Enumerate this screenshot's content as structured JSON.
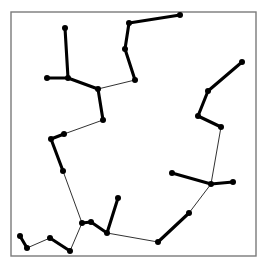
{
  "figure": {
    "title": "",
    "background_color": "#ffffff",
    "frame": {
      "x": 11,
      "y": 12,
      "width": 245,
      "height": 244,
      "stroke_color": "#7a7a7a",
      "fill_color": "#ffffff",
      "stroke_width": 1.4
    }
  },
  "chart_data": {
    "type": "scatter",
    "title": "",
    "xlabel": "",
    "ylabel": "",
    "grid": false,
    "legend": null,
    "axis_visible": false,
    "tick_labels": [],
    "node_style": {
      "shape": "circle",
      "radius": 3.0,
      "color": "#000000"
    },
    "edge_styles": {
      "thick": {
        "color": "#000000",
        "width": 3.1,
        "role": "cluster-chain"
      },
      "thin": {
        "color": "#1a1a1a",
        "width": 0.9,
        "role": "connector"
      }
    },
    "xlim": [
      11,
      256
    ],
    "ylim": [
      12,
      256
    ],
    "nodes": [
      {
        "id": 0,
        "label": "n0",
        "x": 65,
        "y": 28
      },
      {
        "id": 1,
        "label": "n1",
        "x": 68,
        "y": 78
      },
      {
        "id": 2,
        "label": "n2",
        "x": 47,
        "y": 78
      },
      {
        "id": 3,
        "label": "n3",
        "x": 98,
        "y": 89
      },
      {
        "id": 4,
        "label": "n4",
        "x": 103,
        "y": 120
      },
      {
        "id": 5,
        "label": "n5",
        "x": 64,
        "y": 134
      },
      {
        "id": 6,
        "label": "n6",
        "x": 51,
        "y": 139
      },
      {
        "id": 7,
        "label": "n7",
        "x": 63,
        "y": 171
      },
      {
        "id": 8,
        "label": "n8",
        "x": 180,
        "y": 15
      },
      {
        "id": 9,
        "label": "n9",
        "x": 129,
        "y": 23
      },
      {
        "id": 10,
        "label": "n10",
        "x": 125,
        "y": 49
      },
      {
        "id": 11,
        "label": "n11",
        "x": 135,
        "y": 80
      },
      {
        "id": 12,
        "label": "n12",
        "x": 242,
        "y": 62
      },
      {
        "id": 13,
        "label": "n13",
        "x": 208,
        "y": 91
      },
      {
        "id": 14,
        "label": "n14",
        "x": 198,
        "y": 116
      },
      {
        "id": 15,
        "label": "n15",
        "x": 221,
        "y": 127
      },
      {
        "id": 16,
        "label": "n16",
        "x": 172,
        "y": 173
      },
      {
        "id": 17,
        "label": "n17",
        "x": 211,
        "y": 184
      },
      {
        "id": 18,
        "label": "n18",
        "x": 233,
        "y": 182
      },
      {
        "id": 19,
        "label": "n19",
        "x": 189,
        "y": 213
      },
      {
        "id": 20,
        "label": "n20",
        "x": 158,
        "y": 242
      },
      {
        "id": 21,
        "label": "n21",
        "x": 118,
        "y": 198
      },
      {
        "id": 22,
        "label": "n22",
        "x": 107,
        "y": 233
      },
      {
        "id": 23,
        "label": "n23",
        "x": 91,
        "y": 222
      },
      {
        "id": 24,
        "label": "n24",
        "x": 82,
        "y": 223
      },
      {
        "id": 25,
        "label": "n25",
        "x": 70,
        "y": 251
      },
      {
        "id": 26,
        "label": "n26",
        "x": 50,
        "y": 238
      },
      {
        "id": 27,
        "label": "n27",
        "x": 27,
        "y": 248
      },
      {
        "id": 28,
        "label": "n28",
        "x": 20,
        "y": 236
      }
    ],
    "edges": [
      {
        "from": 0,
        "to": 1,
        "style": "thick"
      },
      {
        "from": 2,
        "to": 1,
        "style": "thick"
      },
      {
        "from": 1,
        "to": 3,
        "style": "thick"
      },
      {
        "from": 3,
        "to": 4,
        "style": "thick"
      },
      {
        "from": 3,
        "to": 11,
        "style": "thin"
      },
      {
        "from": 4,
        "to": 5,
        "style": "thin"
      },
      {
        "from": 5,
        "to": 6,
        "style": "thick"
      },
      {
        "from": 6,
        "to": 7,
        "style": "thick"
      },
      {
        "from": 7,
        "to": 24,
        "style": "thin"
      },
      {
        "from": 8,
        "to": 9,
        "style": "thick"
      },
      {
        "from": 9,
        "to": 10,
        "style": "thick"
      },
      {
        "from": 10,
        "to": 11,
        "style": "thick"
      },
      {
        "from": 12,
        "to": 13,
        "style": "thick"
      },
      {
        "from": 13,
        "to": 14,
        "style": "thick"
      },
      {
        "from": 14,
        "to": 15,
        "style": "thick"
      },
      {
        "from": 15,
        "to": 17,
        "style": "thin"
      },
      {
        "from": 16,
        "to": 17,
        "style": "thick"
      },
      {
        "from": 17,
        "to": 18,
        "style": "thick"
      },
      {
        "from": 17,
        "to": 19,
        "style": "thin"
      },
      {
        "from": 19,
        "to": 20,
        "style": "thick"
      },
      {
        "from": 20,
        "to": 22,
        "style": "thin"
      },
      {
        "from": 21,
        "to": 22,
        "style": "thick"
      },
      {
        "from": 22,
        "to": 23,
        "style": "thick"
      },
      {
        "from": 23,
        "to": 24,
        "style": "thick"
      },
      {
        "from": 24,
        "to": 25,
        "style": "thin"
      },
      {
        "from": 25,
        "to": 26,
        "style": "thick"
      },
      {
        "from": 26,
        "to": 27,
        "style": "thin"
      },
      {
        "from": 27,
        "to": 28,
        "style": "thick"
      }
    ]
  }
}
